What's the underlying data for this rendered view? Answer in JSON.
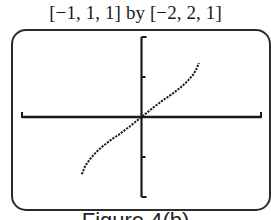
{
  "window_label": "[−1, 1, 1] by [−2, 2, 1]",
  "caption": "Figure 4(b)",
  "colors": {
    "ink": "#1a1a1a",
    "frame": "#2b2b2b",
    "background": "#ffffff"
  },
  "chart_data": {
    "type": "line",
    "title": "[−1, 1, 1] by [−2, 2, 1]",
    "xlabel": "",
    "ylabel": "",
    "xlim": [
      -1,
      1
    ],
    "ylim": [
      -2,
      2
    ],
    "xscl": 1,
    "yscl": 1,
    "grid": false,
    "legend": null,
    "axes": {
      "x_ticks": [
        -1,
        1
      ],
      "y_ticks": [
        -2,
        -1,
        1,
        2
      ]
    },
    "series": [
      {
        "name": "graph",
        "x": [
          -0.5,
          -0.47,
          -0.43,
          -0.38,
          -0.32,
          -0.25,
          -0.18,
          -0.1,
          -0.05,
          0,
          0.05,
          0.1,
          0.18,
          0.25,
          0.32,
          0.38,
          0.43,
          0.46,
          0.48
        ],
        "y": [
          -1.43,
          -1.22,
          -1.05,
          -0.88,
          -0.72,
          -0.56,
          -0.42,
          -0.24,
          -0.12,
          0,
          0.12,
          0.24,
          0.42,
          0.56,
          0.72,
          0.88,
          1.05,
          1.2,
          1.35
        ]
      }
    ]
  }
}
